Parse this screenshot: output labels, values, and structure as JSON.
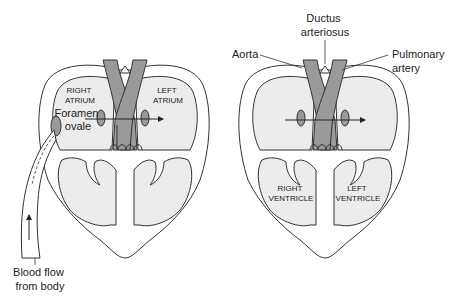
{
  "figure": {
    "left_heart": {
      "chamber_labels": {
        "right_atrium": [
          "RIGHT",
          "ATRIUM"
        ],
        "left_atrium": [
          "LEFT",
          "ATRIUM"
        ]
      },
      "callouts": {
        "foramen_ovale": [
          "Foramen",
          "ovale"
        ],
        "blood_flow": [
          "Blood flow",
          "from body"
        ]
      }
    },
    "right_heart": {
      "chamber_labels": {
        "right_ventricle": [
          "RIGHT",
          "VENTRICLE"
        ],
        "left_ventricle": [
          "LEFT",
          "VENTRICLE"
        ]
      },
      "callouts": {
        "ductus_arteriosus": [
          "Ductus",
          "arteriosus"
        ],
        "aorta": [
          "Aorta"
        ],
        "pulmonary_artery": [
          "Pulmonary",
          "artery"
        ]
      }
    },
    "colors": {
      "vessel_fill": "#9a9a9a",
      "chamber_fill": "#ececec",
      "outline": "#333333"
    }
  }
}
